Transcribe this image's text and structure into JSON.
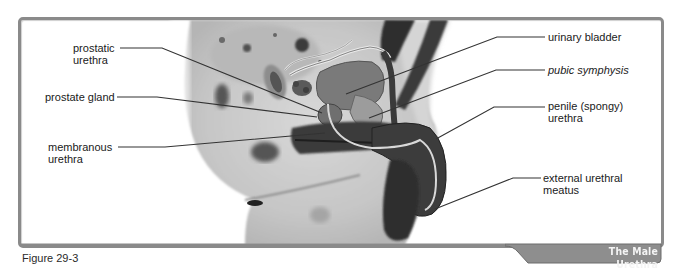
{
  "figure": {
    "caption": "Figure 29-3",
    "title": "The Male Urethra",
    "title_tab_color": "#8e8e8e",
    "frame_border_color": "#8a8a8a"
  },
  "labels": {
    "left": [
      {
        "id": "prostatic-urethra",
        "line1": "prostatic",
        "line2": "urethra",
        "italic": false
      },
      {
        "id": "prostate-gland",
        "line1": "prostate gland",
        "line2": "",
        "italic": false
      },
      {
        "id": "membranous-urethra",
        "line1": "membranous",
        "line2": "urethra",
        "italic": false
      }
    ],
    "right": [
      {
        "id": "urinary-bladder",
        "line1": "urinary bladder",
        "line2": "",
        "italic": false
      },
      {
        "id": "pubic-symphysis",
        "line1": "pubic symphysis",
        "line2": "",
        "italic": true
      },
      {
        "id": "penile-urethra",
        "line1": "penile (spongy)",
        "line2": "urethra",
        "italic": false
      },
      {
        "id": "external-urethral-meatus",
        "line1": "external urethral",
        "line2": "meatus",
        "italic": false
      }
    ]
  }
}
